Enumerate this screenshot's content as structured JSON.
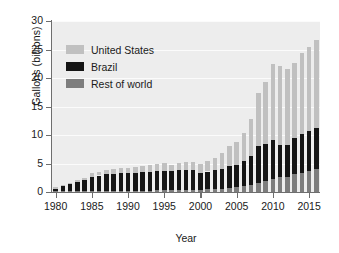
{
  "chart_data": {
    "type": "bar",
    "subtype": "stacked-bar",
    "title": "",
    "xlabel": "Year",
    "ylabel": "Gallons (billions)",
    "ylim": [
      0,
      30
    ],
    "yticks": [
      0,
      5,
      10,
      15,
      20,
      25,
      30
    ],
    "xticks": [
      "1980",
      "1985",
      "1990",
      "1995",
      "2000",
      "2005",
      "2010",
      "2015"
    ],
    "grid": true,
    "legend_position": "upper-left",
    "categories": [
      "1980",
      "1981",
      "1982",
      "1983",
      "1984",
      "1985",
      "1986",
      "1987",
      "1988",
      "1989",
      "1990",
      "1991",
      "1992",
      "1993",
      "1994",
      "1995",
      "1996",
      "1997",
      "1998",
      "1999",
      "2000",
      "2001",
      "2002",
      "2003",
      "2004",
      "2005",
      "2006",
      "2007",
      "2008",
      "2009",
      "2010",
      "2011",
      "2012",
      "2013",
      "2014",
      "2015",
      "2016"
    ],
    "series": [
      {
        "name": "Brazil",
        "color": "#151515",
        "values": [
          0.5,
          0.9,
          1.3,
          1.6,
          2.0,
          2.5,
          2.7,
          2.9,
          3.0,
          3.1,
          3.1,
          3.2,
          3.3,
          3.3,
          3.4,
          3.4,
          3.4,
          3.5,
          3.6,
          3.4,
          2.9,
          3.1,
          3.4,
          3.5,
          3.9,
          4.0,
          4.5,
          5.0,
          6.5,
          6.6,
          6.9,
          5.6,
          5.6,
          6.3,
          6.7,
          7.1,
          7.2
        ]
      },
      {
        "name": "United States",
        "color": "#c0c0c0",
        "values": [
          0.2,
          0.2,
          0.2,
          0.4,
          0.4,
          0.6,
          0.7,
          0.8,
          0.8,
          0.9,
          0.9,
          1.0,
          1.1,
          1.2,
          1.3,
          1.4,
          1.1,
          1.3,
          1.4,
          1.5,
          1.6,
          1.8,
          2.1,
          2.8,
          3.4,
          3.9,
          4.9,
          6.5,
          9.2,
          10.8,
          13.3,
          13.9,
          13.2,
          13.3,
          14.3,
          14.8,
          15.4
        ]
      },
      {
        "name": "Rest of world",
        "color": "#7d7d7d",
        "values": [
          0.1,
          0.1,
          0.1,
          0.1,
          0.1,
          0.2,
          0.2,
          0.2,
          0.2,
          0.2,
          0.2,
          0.2,
          0.2,
          0.2,
          0.3,
          0.3,
          0.3,
          0.3,
          0.3,
          0.4,
          0.4,
          0.5,
          0.5,
          0.6,
          0.7,
          0.8,
          1.0,
          1.3,
          1.6,
          1.9,
          2.3,
          2.6,
          2.7,
          3.1,
          3.4,
          3.6,
          4.0
        ]
      }
    ],
    "stack_order_bottom_to_top": [
      "Rest of world",
      "Brazil",
      "United States"
    ],
    "totals": [
      0.8,
      1.2,
      1.6,
      2.1,
      2.5,
      3.3,
      3.6,
      3.9,
      4.0,
      4.2,
      4.2,
      4.4,
      4.6,
      4.7,
      5.0,
      5.1,
      4.8,
      5.1,
      5.3,
      5.3,
      4.9,
      5.4,
      6.0,
      6.9,
      8.0,
      8.7,
      10.4,
      12.8,
      17.3,
      19.3,
      22.5,
      22.1,
      21.5,
      22.7,
      24.4,
      25.5,
      26.6
    ]
  },
  "legend": {
    "items": [
      {
        "label": "United States",
        "swatch": "#c0c0c0"
      },
      {
        "label": "Brazil",
        "swatch": "#151515"
      },
      {
        "label": "Rest of world",
        "swatch": "#7d7d7d"
      }
    ]
  },
  "axes": {
    "y_title": "Gallons (billions)",
    "x_title": "Year"
  },
  "colors": {
    "plot_background": "#ededed",
    "gridline": "#fbfbfb",
    "axis": "#6e6e6e",
    "text": "#1a1a1a",
    "page_background": "#ffffff"
  }
}
